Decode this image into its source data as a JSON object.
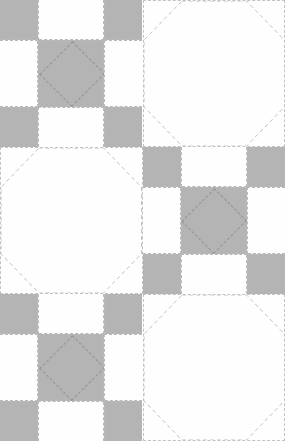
{
  "figure": {
    "type": "quilt-pattern-diagram",
    "canvas": {
      "width": 285,
      "height": 441
    },
    "colors": {
      "fabric_gray": "#b4b4b4",
      "fabric_white": "#fefefe",
      "background": "#ffffff",
      "seam_line": "#b9b9b9",
      "quilting_line": "#949494",
      "octagon_line": "#c2c2c2"
    },
    "grid": {
      "columns": 2,
      "rows": 3,
      "block_width": 142.5,
      "block_height": 147,
      "note": "bottom row is cropped by the canvas edge"
    },
    "block_types": {
      "ninepatch": {
        "label": "nine-patch block",
        "cell_fractions_x": [
          0.27,
          0.46,
          0.27
        ],
        "cell_fractions_y": [
          0.27,
          0.46,
          0.27
        ],
        "cells": [
          "gray",
          "white",
          "gray",
          "white",
          "gray",
          "white",
          "gray",
          "white",
          "gray"
        ],
        "center_motif": "on-point dashed diamond"
      },
      "snowball": {
        "label": "snowball octagon block",
        "corner_cut_fraction": 0.27,
        "motif": "dashed octagon outline on white"
      }
    },
    "blocks": [
      {
        "name": "block-r1-c1",
        "type": "ninepatch",
        "row": 1,
        "col": 1,
        "x": 0,
        "y": 0
      },
      {
        "name": "block-r1-c2",
        "type": "snowball",
        "row": 1,
        "col": 2,
        "x": 142.5,
        "y": 0
      },
      {
        "name": "block-r2-c1",
        "type": "snowball",
        "row": 2,
        "col": 1,
        "x": 0,
        "y": 147
      },
      {
        "name": "block-r2-c2",
        "type": "ninepatch",
        "row": 2,
        "col": 2,
        "x": 142.5,
        "y": 147
      },
      {
        "name": "block-r3-c1",
        "type": "ninepatch",
        "row": 3,
        "col": 1,
        "x": 0,
        "y": 294
      },
      {
        "name": "block-r3-c2",
        "type": "snowball",
        "row": 3,
        "col": 2,
        "x": 142.5,
        "y": 294
      }
    ]
  }
}
